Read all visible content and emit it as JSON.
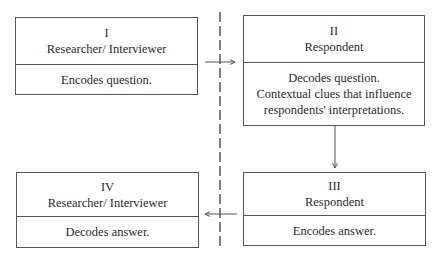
{
  "boxes": [
    {
      "numeral": "I",
      "role": "Researcher/ Interviewer",
      "lines": [
        "Encodes question."
      ]
    },
    {
      "numeral": "II",
      "role": "Respondent",
      "lines": [
        "Decodes question.",
        "Contextual clues that influence",
        "respondents' interpretations."
      ]
    },
    {
      "numeral": "III",
      "role": "Respondent",
      "lines": [
        "Encodes answer."
      ]
    },
    {
      "numeral": "IV",
      "role": "Researcher/ Interviewer",
      "lines": [
        "Decodes answer."
      ]
    }
  ],
  "connectors": [
    {
      "from": "I",
      "to": "II",
      "direction": "right"
    },
    {
      "from": "II",
      "to": "III",
      "direction": "down"
    },
    {
      "from": "III",
      "to": "IV",
      "direction": "left"
    }
  ],
  "divider": {
    "style": "dashed",
    "orientation": "vertical"
  },
  "colors": {
    "line": "#555555",
    "text": "#2a2a2a",
    "background": "#ffffff"
  }
}
